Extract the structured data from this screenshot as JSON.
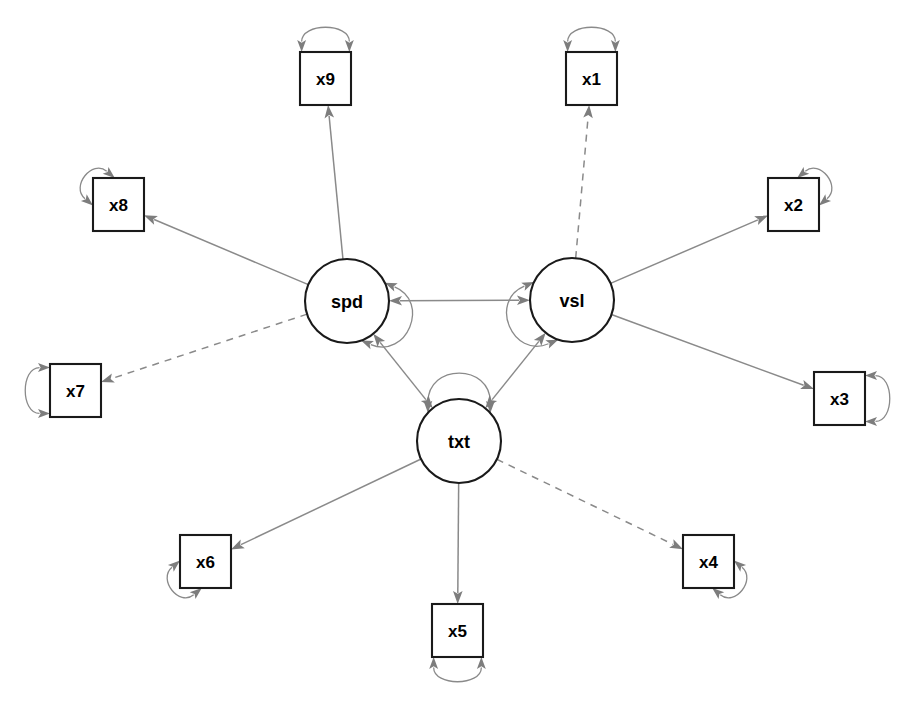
{
  "diagram": {
    "type": "sem-path-diagram",
    "title": "",
    "background_color": "#ffffff",
    "node_stroke_color": "#1a1a1a",
    "edge_color": "#8a8a8a",
    "arrow_color": "#7d7d7d",
    "label_color": "#000000"
  },
  "latents": [
    {
      "id": "spd",
      "label": "spd",
      "cx": 347,
      "cy": 301,
      "r": 42
    },
    {
      "id": "vsl",
      "label": "vsl",
      "cx": 572,
      "cy": 300,
      "r": 42
    },
    {
      "id": "txt",
      "label": "txt",
      "cx": 459,
      "cy": 441,
      "r": 42
    }
  ],
  "manifests": [
    {
      "id": "x1",
      "label": "x1",
      "x": 566,
      "y": 52,
      "w": 51,
      "h": 53,
      "loop": "top"
    },
    {
      "id": "x2",
      "label": "x2",
      "x": 768,
      "y": 178,
      "w": 51,
      "h": 53,
      "loop": "top-right"
    },
    {
      "id": "x3",
      "label": "x3",
      "x": 814,
      "y": 372,
      "w": 51,
      "h": 53,
      "loop": "right"
    },
    {
      "id": "x4",
      "label": "x4",
      "x": 683,
      "y": 535,
      "w": 51,
      "h": 53,
      "loop": "bottom-right"
    },
    {
      "id": "x5",
      "label": "x5",
      "x": 432,
      "y": 604,
      "w": 51,
      "h": 53,
      "loop": "bottom"
    },
    {
      "id": "x6",
      "label": "x6",
      "x": 180,
      "y": 535,
      "w": 51,
      "h": 53,
      "loop": "bottom-left"
    },
    {
      "id": "x7",
      "label": "x7",
      "x": 50,
      "y": 364,
      "w": 51,
      "h": 53,
      "loop": "left"
    },
    {
      "id": "x8",
      "label": "x8",
      "x": 93,
      "y": 178,
      "w": 51,
      "h": 53,
      "loop": "top-left"
    },
    {
      "id": "x9",
      "label": "x9",
      "x": 300,
      "y": 52,
      "w": 51,
      "h": 53,
      "loop": "top"
    }
  ],
  "loadings": [
    {
      "from": "vsl",
      "to": "x1",
      "style": "dashed"
    },
    {
      "from": "vsl",
      "to": "x2",
      "style": "solid"
    },
    {
      "from": "vsl",
      "to": "x3",
      "style": "solid"
    },
    {
      "from": "txt",
      "to": "x4",
      "style": "dashed"
    },
    {
      "from": "txt",
      "to": "x5",
      "style": "solid"
    },
    {
      "from": "txt",
      "to": "x6",
      "style": "solid"
    },
    {
      "from": "spd",
      "to": "x7",
      "style": "dashed"
    },
    {
      "from": "spd",
      "to": "x8",
      "style": "solid"
    },
    {
      "from": "spd",
      "to": "x9",
      "style": "solid"
    }
  ],
  "covariances": [
    {
      "between": [
        "spd",
        "vsl"
      ]
    },
    {
      "between": [
        "spd",
        "txt"
      ]
    },
    {
      "between": [
        "vsl",
        "txt"
      ]
    }
  ],
  "variances": [
    {
      "node": "spd",
      "kind": "latent"
    },
    {
      "node": "vsl",
      "kind": "latent"
    },
    {
      "node": "txt",
      "kind": "latent"
    },
    {
      "node": "x1",
      "kind": "residual"
    },
    {
      "node": "x2",
      "kind": "residual"
    },
    {
      "node": "x3",
      "kind": "residual"
    },
    {
      "node": "x4",
      "kind": "residual"
    },
    {
      "node": "x5",
      "kind": "residual"
    },
    {
      "node": "x6",
      "kind": "residual"
    },
    {
      "node": "x7",
      "kind": "residual"
    },
    {
      "node": "x8",
      "kind": "residual"
    },
    {
      "node": "x9",
      "kind": "residual"
    }
  ]
}
